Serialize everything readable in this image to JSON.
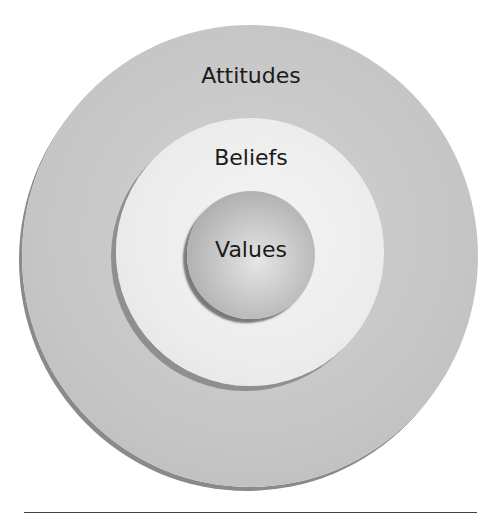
{
  "diagram": {
    "title": "",
    "layers": [
      {
        "label": "Attitudes",
        "level": "outer",
        "fill": "#c6c6c6"
      },
      {
        "label": "Beliefs",
        "level": "middle",
        "fill": "#ececec"
      },
      {
        "label": "Values",
        "level": "inner",
        "fill": "#bdbdbd"
      }
    ]
  }
}
